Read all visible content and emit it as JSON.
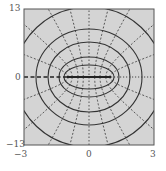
{
  "figure": {
    "type": "confocal elliptic coordinate grid",
    "background_color": "#d4d4d4",
    "line_color": "#333333",
    "x_axis": {
      "min": -3,
      "max": 3,
      "ticks": [
        "-3",
        "0",
        "3"
      ]
    },
    "y_axis": {
      "min": -13,
      "max": 13,
      "ticks": [
        "13",
        "0",
        "-13"
      ]
    },
    "ellipses_semi_axes_px": [
      [
        25,
        12
      ],
      [
        30,
        20
      ],
      [
        41,
        35
      ],
      [
        53,
        48
      ],
      [
        74,
        70
      ]
    ],
    "hyperbola_angles_deg": [
      20,
      40,
      60,
      75
    ],
    "focus_offset_px": 22,
    "center_segment": "solid between foci",
    "left_ray": "thick dashed",
    "right_ray": "dotted"
  },
  "labels": {
    "y_top": "13",
    "y_mid": "0",
    "y_bottom": "−13",
    "x_left": "−3",
    "x_mid": "0",
    "x_right": "3"
  }
}
